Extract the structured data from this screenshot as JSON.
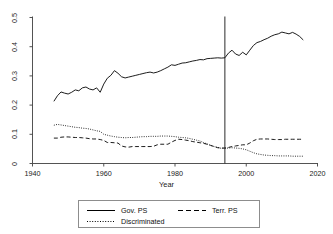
{
  "chart_data": {
    "type": "line",
    "title": "",
    "xlabel": "Year",
    "ylabel": "",
    "xlim": [
      1940,
      2020
    ],
    "ylim": [
      0,
      0.5
    ],
    "xticks": [
      "1940",
      "1960",
      "1980",
      "2000",
      "2020"
    ],
    "xtick_values": [
      1940,
      1960,
      1980,
      2000,
      2020
    ],
    "yticks": [
      "0",
      "0.1",
      "0.2",
      "0.3",
      "0.4",
      "0.5"
    ],
    "ytick_values": [
      0,
      0.1,
      0.2,
      0.3,
      0.4,
      0.5
    ],
    "grid": false,
    "legend_position": "below-axis",
    "annotations": [
      {
        "type": "vline",
        "x": 1994,
        "label": ""
      }
    ],
    "x": [
      1946,
      1947,
      1948,
      1949,
      1950,
      1951,
      1952,
      1953,
      1954,
      1955,
      1956,
      1957,
      1958,
      1959,
      1960,
      1961,
      1962,
      1963,
      1964,
      1965,
      1966,
      1967,
      1968,
      1969,
      1970,
      1971,
      1972,
      1973,
      1974,
      1975,
      1976,
      1977,
      1978,
      1979,
      1980,
      1981,
      1982,
      1983,
      1984,
      1985,
      1986,
      1987,
      1988,
      1989,
      1990,
      1991,
      1992,
      1993,
      1994,
      1995,
      1996,
      1997,
      1998,
      1999,
      2000,
      2001,
      2002,
      2003,
      2004,
      2005,
      2006,
      2007,
      2008,
      2009,
      2010,
      2011,
      2012,
      2013,
      2014,
      2015,
      2016
    ],
    "series": [
      {
        "name": "Gov. PS",
        "style": "solid",
        "values": [
          0.213,
          0.232,
          0.245,
          0.241,
          0.238,
          0.244,
          0.252,
          0.249,
          0.259,
          0.262,
          0.255,
          0.252,
          0.259,
          0.244,
          0.272,
          0.292,
          0.302,
          0.318,
          0.309,
          0.297,
          0.293,
          0.296,
          0.299,
          0.302,
          0.305,
          0.308,
          0.311,
          0.313,
          0.31,
          0.313,
          0.318,
          0.324,
          0.33,
          0.338,
          0.336,
          0.34,
          0.344,
          0.345,
          0.348,
          0.351,
          0.353,
          0.356,
          0.355,
          0.359,
          0.36,
          0.361,
          0.362,
          0.361,
          0.362,
          0.378,
          0.388,
          0.375,
          0.37,
          0.381,
          0.372,
          0.388,
          0.404,
          0.414,
          0.418,
          0.424,
          0.429,
          0.436,
          0.441,
          0.444,
          0.45,
          0.447,
          0.444,
          0.449,
          0.443,
          0.435,
          0.423
        ]
      },
      {
        "name": "Terr. PS",
        "style": "dashed",
        "values": [
          0.087,
          0.087,
          0.09,
          0.091,
          0.091,
          0.09,
          0.089,
          0.089,
          0.088,
          0.087,
          0.085,
          0.084,
          0.084,
          0.082,
          0.079,
          0.072,
          0.072,
          0.071,
          0.07,
          0.06,
          0.057,
          0.056,
          0.058,
          0.058,
          0.058,
          0.058,
          0.058,
          0.058,
          0.059,
          0.064,
          0.066,
          0.066,
          0.066,
          0.073,
          0.079,
          0.083,
          0.082,
          0.08,
          0.078,
          0.075,
          0.073,
          0.071,
          0.069,
          0.066,
          0.062,
          0.058,
          0.054,
          0.053,
          0.053,
          0.055,
          0.058,
          0.06,
          0.062,
          0.064,
          0.064,
          0.07,
          0.078,
          0.083,
          0.084,
          0.084,
          0.084,
          0.083,
          0.082,
          0.082,
          0.082,
          0.083,
          0.083,
          0.083,
          0.083,
          0.083,
          0.083
        ]
      },
      {
        "name": "Discriminated",
        "style": "dotted",
        "values": [
          0.131,
          0.134,
          0.132,
          0.13,
          0.128,
          0.126,
          0.124,
          0.123,
          0.121,
          0.12,
          0.118,
          0.115,
          0.112,
          0.11,
          0.1,
          0.097,
          0.094,
          0.092,
          0.09,
          0.089,
          0.088,
          0.089,
          0.089,
          0.09,
          0.091,
          0.092,
          0.092,
          0.093,
          0.093,
          0.093,
          0.094,
          0.094,
          0.094,
          0.093,
          0.092,
          0.09,
          0.089,
          0.088,
          0.086,
          0.083,
          0.08,
          0.077,
          0.072,
          0.067,
          0.062,
          0.058,
          0.055,
          0.052,
          0.052,
          0.053,
          0.054,
          0.053,
          0.052,
          0.05,
          0.047,
          0.042,
          0.037,
          0.033,
          0.031,
          0.029,
          0.028,
          0.027,
          0.027,
          0.026,
          0.026,
          0.026,
          0.026,
          0.025,
          0.025,
          0.025,
          0.025
        ]
      }
    ]
  },
  "axis": {
    "xlabel": "Year",
    "xticks": [
      "1940",
      "1960",
      "1980",
      "2000",
      "2020"
    ],
    "yticks": [
      "0",
      "0.1",
      "0.2",
      "0.3",
      "0.4",
      "0.5"
    ]
  },
  "legend": {
    "entries": [
      {
        "label": "Gov. PS",
        "style": "solid"
      },
      {
        "label": "Terr. PS",
        "style": "dashed"
      },
      {
        "label": "Discriminated",
        "style": "dotted"
      }
    ]
  },
  "title": ""
}
